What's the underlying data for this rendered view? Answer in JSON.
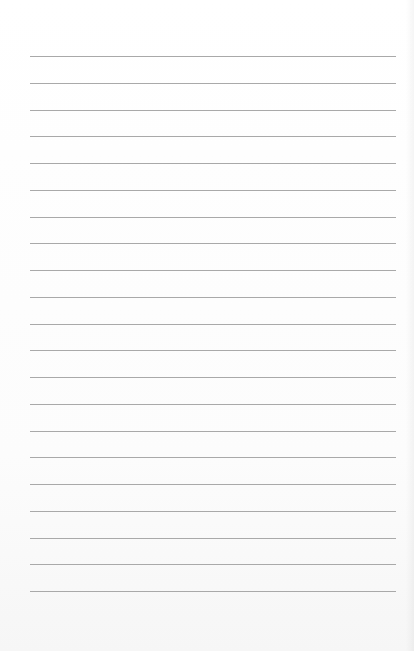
{
  "page": {
    "type": "lined-paper",
    "background": "#ffffff",
    "line_color": "#a9a9a9",
    "line_count": 21,
    "first_line_y": 56,
    "line_spacing": 26.75,
    "line_left": 30,
    "line_width": 366
  }
}
